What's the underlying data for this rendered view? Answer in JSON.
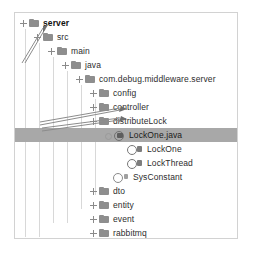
{
  "panel": {
    "name": "project-tree-panel",
    "selection_color": "#a8a8a8",
    "border_color": "#d2d2d2",
    "text_color": "#2d2d2d"
  },
  "tree": {
    "rows": [
      {
        "label": "server",
        "indent": 0,
        "icon": "folder-icon",
        "toggle": "plus",
        "bold": true,
        "selected": false
      },
      {
        "label": "src",
        "indent": 1,
        "icon": "folder-icon",
        "toggle": "plus",
        "bold": false,
        "selected": false
      },
      {
        "label": "main",
        "indent": 2,
        "icon": "folder-icon",
        "toggle": "plus",
        "bold": false,
        "selected": false
      },
      {
        "label": "java",
        "indent": 3,
        "icon": "folder-icon",
        "toggle": "plus",
        "bold": false,
        "selected": false
      },
      {
        "label": "com.debug.middleware.server",
        "indent": 4,
        "icon": "package-icon",
        "toggle": "plus",
        "bold": false,
        "selected": false
      },
      {
        "label": "config",
        "indent": 5,
        "icon": "package-icon",
        "toggle": "plus",
        "bold": false,
        "selected": false
      },
      {
        "label": "controller",
        "indent": 5,
        "icon": "package-icon",
        "toggle": "plus",
        "bold": false,
        "selected": false
      },
      {
        "label": "distributeLock",
        "indent": 5,
        "icon": "package-icon",
        "toggle": "plus",
        "bold": false,
        "selected": false
      },
      {
        "label": "LockOne.java",
        "indent": 6,
        "icon": "java-file-icon",
        "toggle": "circle",
        "bold": false,
        "selected": true
      },
      {
        "label": "LockOne",
        "indent": 7,
        "icon": "java-class-lock-icon",
        "toggle": "none",
        "bold": false,
        "selected": false
      },
      {
        "label": "LockThread",
        "indent": 7,
        "icon": "java-class-lock-icon",
        "toggle": "none",
        "bold": false,
        "selected": false
      },
      {
        "label": "SysConstant",
        "indent": 6,
        "icon": "java-class-icon",
        "toggle": "none",
        "bold": false,
        "selected": false
      },
      {
        "label": "dto",
        "indent": 5,
        "icon": "package-icon",
        "toggle": "plus",
        "bold": false,
        "selected": false
      },
      {
        "label": "entity",
        "indent": 5,
        "icon": "package-icon",
        "toggle": "plus",
        "bold": false,
        "selected": false
      },
      {
        "label": "event",
        "indent": 5,
        "icon": "package-icon",
        "toggle": "plus",
        "bold": false,
        "selected": false
      },
      {
        "label": "rabbitmq",
        "indent": 5,
        "icon": "package-icon",
        "toggle": "plus",
        "bold": false,
        "selected": false
      },
      {
        "label": "service",
        "indent": 5,
        "icon": "package-icon",
        "toggle": "plus",
        "bold": false,
        "selected": false
      },
      {
        "label": "utils",
        "indent": 5,
        "icon": "package-icon",
        "toggle": "plus",
        "bold": false,
        "selected": false
      },
      {
        "label": "MainApplication",
        "indent": 6,
        "icon": "java-app-class-icon",
        "toggle": "none",
        "bold": false,
        "selected": false
      },
      {
        "label": "resources",
        "indent": 3,
        "icon": "resources-folder-icon",
        "toggle": "plus",
        "bold": false,
        "selected": false
      },
      {
        "label": "test",
        "indent": 2,
        "icon": "folder-icon",
        "toggle": "plus",
        "bold": false,
        "selected": false
      },
      {
        "label": "target",
        "indent": 1,
        "icon": "folder-icon",
        "toggle": "plus",
        "bold": false,
        "selected": false
      }
    ]
  },
  "annotations": [
    {
      "name": "arrow-to-src",
      "kind": "arrow-line"
    },
    {
      "name": "arrow-to-lockone",
      "kind": "arrow-line"
    },
    {
      "name": "arrow-to-lockthread",
      "kind": "arrow-line"
    }
  ]
}
